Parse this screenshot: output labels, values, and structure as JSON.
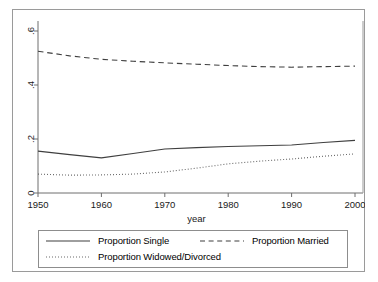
{
  "chart_data": {
    "type": "line",
    "title": "",
    "xlabel": "year",
    "ylabel": "",
    "xlim": [
      1950,
      2000
    ],
    "ylim": [
      0,
      0.6
    ],
    "grid": false,
    "legend_position": "bottom",
    "xticks": [
      "1950",
      "1960",
      "1970",
      "1980",
      "1990",
      "2000"
    ],
    "xtick_values": [
      1950,
      1960,
      1970,
      1980,
      1990,
      2000
    ],
    "yticks": [
      "0",
      ".2",
      ".4",
      ".6"
    ],
    "ytick_values": [
      0,
      0.2,
      0.4,
      0.6
    ],
    "x": [
      1950,
      1955,
      1960,
      1965,
      1970,
      1975,
      1980,
      1985,
      1990,
      1995,
      2000
    ],
    "series": [
      {
        "name": "Proportion Single",
        "style": "solid",
        "values": [
          0.155,
          0.142,
          0.13,
          0.146,
          0.163,
          0.168,
          0.172,
          0.175,
          0.178,
          0.187,
          0.195
        ]
      },
      {
        "name": "Proportion Married",
        "style": "dashed",
        "values": [
          0.525,
          0.508,
          0.495,
          0.488,
          0.482,
          0.477,
          0.472,
          0.468,
          0.466,
          0.468,
          0.47
        ]
      },
      {
        "name": "Proportion Widowed/Divorced",
        "style": "dotted",
        "values": [
          0.07,
          0.066,
          0.067,
          0.07,
          0.078,
          0.092,
          0.108,
          0.118,
          0.126,
          0.136,
          0.145
        ]
      }
    ]
  },
  "legend": {
    "entries": [
      {
        "label": "Proportion Single",
        "style": "solid"
      },
      {
        "label": "Proportion Married",
        "style": "dashed"
      },
      {
        "label": "Proportion Widowed/Divorced",
        "style": "dotted"
      }
    ]
  },
  "colors": {
    "line": "#3f3f3f",
    "axis": "#6e6e6e",
    "frame": "#9a9a9a",
    "text": "#1a1a1a",
    "background": "#ffffff"
  }
}
